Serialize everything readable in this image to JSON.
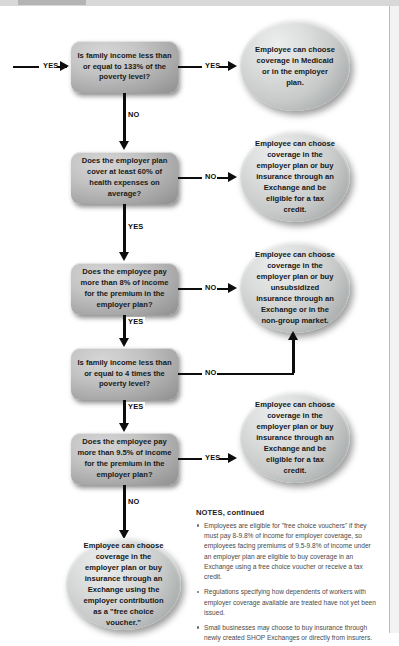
{
  "entry": {
    "label": "YES"
  },
  "decisions": [
    {
      "id": "d1",
      "text": "Is family income less than or equal to 133% of the poverty level?",
      "yes_label": "YES",
      "no_label": "NO"
    },
    {
      "id": "d2",
      "text": "Does the employer plan cover at least 60% of health expenses on average?",
      "yes_label": "YES",
      "no_label": "NO"
    },
    {
      "id": "d3",
      "text": "Does the employee pay more than 8% of income for the premium in the employer plan?",
      "yes_label": "YES",
      "no_label": "NO"
    },
    {
      "id": "d4",
      "text": "Is family income less than or equal to 4 times the poverty level?",
      "yes_label": "YES",
      "no_label": "NO"
    },
    {
      "id": "d5",
      "text": "Does the employee pay more than 9.5% of income for the premium in the employer plan?",
      "yes_label": "YES",
      "no_label": "NO"
    }
  ],
  "outcomes": [
    {
      "id": "o1",
      "text": "Employee can choose coverage in Medicaid or in the employer plan."
    },
    {
      "id": "o2",
      "text": "Employee can choose coverage in the employer plan or buy insurance through an Exchange and be eligible for a tax credit."
    },
    {
      "id": "o3",
      "text": "Employee can choose coverage in the employer plan or buy unsubsidized insurance through an Exchange or in the non-group market."
    },
    {
      "id": "o4",
      "text": "Employee can choose coverage in the employer plan or buy insurance through an Exchange and be eligible for a tax credit."
    },
    {
      "id": "o5",
      "text": "Employee can choose coverage in the employer plan or buy insurance through an Exchange using the employer contribution as a \"free choice voucher.\""
    }
  ],
  "notes": {
    "title": "NOTES, continued",
    "items": [
      "Employees are eligible for \"free choice vouchers\" if they must pay 8-9.8% of income for employer coverage, so employees facing premiums of 9.5-9.8% of income under an employer plan are eligible to buy coverage in an Exchange using a free choice voucher or receive a tax credit.",
      "Regulations specifying how dependents of workers with employer coverage available are treated have not yet been issued.",
      "Small businesses may choose to buy insurance through newly created SHOP Exchanges or directly from insurers."
    ]
  },
  "colors": {
    "line": "#0d0d0d",
    "box_fill": "#b4b4b4",
    "circle_fill": "#d2d4d4",
    "page_bg": "#ffffff"
  }
}
